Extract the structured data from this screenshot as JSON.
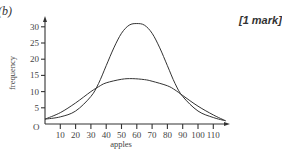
{
  "question": {
    "part_label": "(b)",
    "marks": "[1 mark]"
  },
  "chart_data": {
    "type": "line",
    "title": "",
    "xlabel": "apples",
    "ylabel": "frequency",
    "origin_label": "O",
    "xlim": [
      0,
      120
    ],
    "ylim": [
      0,
      33
    ],
    "grid": false,
    "legend": null,
    "x_ticks": [
      10,
      20,
      30,
      40,
      50,
      60,
      70,
      80,
      90,
      100,
      110
    ],
    "y_ticks": [
      5,
      10,
      15,
      20,
      25,
      30
    ],
    "series": [
      {
        "name": "tall narrow distribution",
        "x": [
          0,
          10,
          20,
          30,
          35,
          40,
          45,
          50,
          55,
          60,
          65,
          70,
          75,
          80,
          85,
          90,
          100,
          110,
          118
        ],
        "y": [
          1.5,
          2.2,
          4,
          8.5,
          12.5,
          18,
          23.5,
          28,
          30.5,
          31,
          30.5,
          28,
          23.5,
          18,
          12.5,
          8.5,
          4,
          2,
          1
        ]
      },
      {
        "name": "wide flat distribution",
        "x": [
          0,
          10,
          20,
          30,
          35,
          40,
          50,
          57,
          65,
          70,
          80,
          85,
          90,
          100,
          110,
          118
        ],
        "y": [
          1.5,
          3.5,
          6.5,
          10,
          11.5,
          12.7,
          13.8,
          14,
          13.7,
          13.2,
          11.8,
          10.5,
          8.8,
          5.5,
          2.8,
          1
        ]
      }
    ]
  }
}
